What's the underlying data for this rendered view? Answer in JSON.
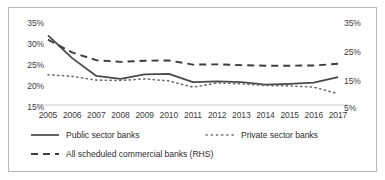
{
  "chart_data": {
    "type": "line",
    "title": "",
    "xlabel": "",
    "ylabel": "",
    "categories": [
      2005,
      2006,
      2007,
      2008,
      2009,
      2010,
      2011,
      2012,
      2013,
      2014,
      2015,
      2016,
      2017
    ],
    "x_tick_labels": [
      "2005",
      "2006",
      "2007",
      "2008",
      "2009",
      "2010",
      "2011",
      "2012",
      "2013",
      "2014",
      "2015",
      "2016",
      "2017"
    ],
    "left_axis": {
      "label": "",
      "ticks": [
        15,
        20,
        25,
        30,
        35
      ],
      "tick_labels": [
        "15%",
        "20%",
        "25%",
        "30%",
        "35%"
      ],
      "ylim": [
        15,
        35
      ]
    },
    "right_axis": {
      "label": "RHS",
      "ticks": [
        5,
        15,
        25,
        35
      ],
      "tick_labels": [
        "5%",
        "15%",
        "25%",
        "35%"
      ],
      "ylim": [
        5,
        35
      ]
    },
    "grid": false,
    "legend_position": "bottom",
    "series": [
      {
        "name": "Public sector banks",
        "axis": "left",
        "style": "solid",
        "color": "#4a4a4a",
        "values": [
          31.8,
          26.3,
          22.0,
          21.3,
          22.4,
          22.5,
          20.5,
          20.7,
          20.5,
          19.9,
          20.1,
          20.4,
          21.7
        ]
      },
      {
        "name": "Private sector banks",
        "axis": "left",
        "style": "dotted",
        "color": "#6d6d6d",
        "values": [
          22.3,
          21.9,
          21.0,
          20.9,
          21.3,
          20.8,
          19.3,
          20.3,
          20.1,
          19.7,
          19.6,
          19.3,
          17.7
        ]
      },
      {
        "name": "All scheduled commercial banks (RHS)",
        "axis": "right",
        "style": "dashed",
        "color": "#3d3d3d",
        "values": [
          28.6,
          24.0,
          21.2,
          20.6,
          21.0,
          21.1,
          19.6,
          19.7,
          19.4,
          19.2,
          19.2,
          19.3,
          19.9
        ]
      }
    ],
    "legend_entries": [
      "Public sector banks",
      "Private sector banks",
      "All scheduled commercial banks (RHS)"
    ],
    "colors": {
      "axis_text": "#3b3b3b",
      "baseline": "#c9c9c9",
      "frame_border": "#b9b9b9",
      "background": "#ffffff"
    }
  }
}
